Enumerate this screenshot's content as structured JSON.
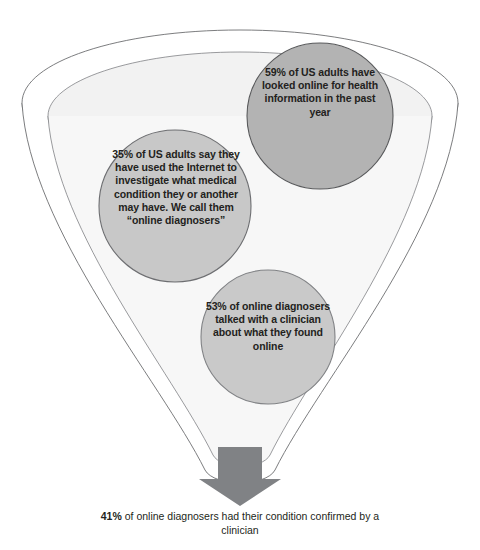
{
  "diagram": {
    "type": "funnel-with-proportional-bubbles",
    "background_color": "#ffffff",
    "funnel": {
      "name": "funnel-outline",
      "outer_rim_color": "#6d6e71",
      "interior_fill": "#f2f2f2",
      "inner_ellipse_fill": "#ebebeb",
      "stroke_width": 0.9
    },
    "bubbles": [
      {
        "id": "bubble-59",
        "name": "bubble-59-percent",
        "stat": "59%",
        "text": "59% of US adults have looked online for health information in the past year",
        "fill": "#b3b3b3",
        "stroke": "#58595b",
        "cx": 320,
        "cy": 116,
        "r": 73
      },
      {
        "id": "bubble-35",
        "name": "bubble-35-percent",
        "stat": "35%",
        "text": "35% of US adults say they have used the Internet to investigate what medical condition they or another may have. We call them “online diagnosers”",
        "fill": "#c4c4c4",
        "stroke": "#6d6e71",
        "cx": 175,
        "cy": 206,
        "r": 76
      },
      {
        "id": "bubble-53",
        "name": "bubble-53-percent",
        "stat": "53%",
        "text": "53% of online diagnosers talked with a clinician about what they found online",
        "fill": "#c9c9c9",
        "stroke": "#808285",
        "cx": 268,
        "cy": 337,
        "r": 67
      }
    ],
    "arrow": {
      "name": "down-arrow",
      "color": "#808285",
      "direction": "down"
    },
    "footer": {
      "name": "footer-caption",
      "stat": "41%",
      "rest": " of online diagnosers had their condition confirmed by a clinician",
      "full_text": "41% of online diagnosers had their condition confirmed by a clinician"
    }
  }
}
